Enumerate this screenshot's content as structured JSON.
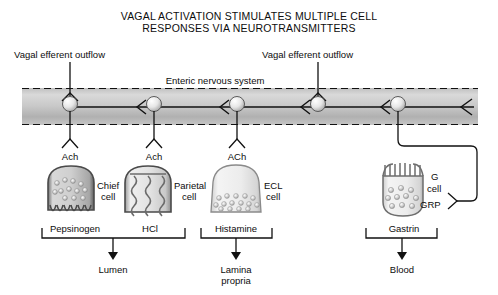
{
  "title": {
    "line1": "VAGAL ACTIVATION STIMULATES MULTIPLE CELL",
    "line2": "RESPONSES VIA NEUROTRANSMITTERS"
  },
  "labels": {
    "vagal_left": "Vagal efferent outflow",
    "vagal_right": "Vagal efferent outflow",
    "enteric": "Enteric nervous system"
  },
  "plus_signs": [
    "+",
    "+",
    "+",
    "+",
    "+",
    "+",
    "+"
  ],
  "neurotransmitters": [
    {
      "name": "ach-1",
      "text": "Ach"
    },
    {
      "name": "ach-2",
      "text": "Ach"
    },
    {
      "name": "ach-3",
      "text": "ACh"
    }
  ],
  "cells": [
    {
      "id": "chief",
      "name_line1": "Chief",
      "name_line2": "cell",
      "product": "Pepsinogen"
    },
    {
      "id": "parietal",
      "name_line1": "Parietal",
      "name_line2": "cell",
      "product": "HCl"
    },
    {
      "id": "ecl",
      "name_line1": "ECL",
      "name_line2": "cell",
      "product": "Histamine"
    },
    {
      "id": "gcell",
      "name_line1": "G",
      "name_line2": "cell",
      "product": "Gastrin"
    }
  ],
  "gcell_transmitter": "GRP",
  "destinations": [
    {
      "id": "lumen",
      "line1": "Lumen",
      "line2": ""
    },
    {
      "id": "lamina",
      "line1": "Lamina",
      "line2": "propria"
    },
    {
      "id": "blood",
      "line1": "Blood",
      "line2": ""
    }
  ],
  "colors": {
    "band_light": "#d6d6d6",
    "band_dark": "#9a9a9a",
    "line": "#111111",
    "cell_fill": "#e8e8e8",
    "cell_stroke": "#555555",
    "granule": "#bdbdbd"
  }
}
